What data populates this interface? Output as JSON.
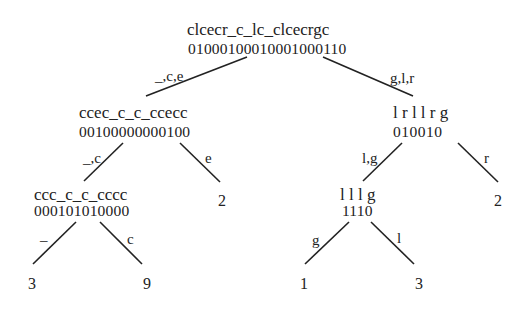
{
  "diagram": {
    "type": "wavelet-tree",
    "root": {
      "sequence": "clcecr_c_lc_clcecrgc",
      "bits": "01000100010001000110"
    },
    "edges": {
      "root_left": "_,c,e",
      "root_right": "g,l,r",
      "left_left": "_,c",
      "left_right": "e",
      "ll_left": "_",
      "ll_right": "c",
      "right_left": "l,g",
      "right_right": "r",
      "rl_left": "g",
      "rl_right": "l"
    },
    "left": {
      "sequence": "ccec_c_c_ccecc",
      "bits": "00100000000100",
      "left": {
        "sequence": "ccc_c_c_cccc",
        "bits": "000101010000",
        "leaf_left": "3",
        "leaf_right": "9"
      },
      "leaf_right": "2"
    },
    "right": {
      "sequence": "l r l l r g",
      "bits": "010010",
      "left": {
        "sequence": "l l l g",
        "bits": "1110",
        "leaf_left": "1",
        "leaf_right": "3"
      },
      "leaf_right": "2"
    }
  }
}
